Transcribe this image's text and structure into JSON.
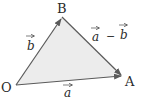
{
  "diagram": {
    "title": "",
    "type": "vector-triangle",
    "colors": {
      "fill": "#ececec",
      "stroke": "#5a5a5a",
      "text": "#2a2a2a",
      "background": "#ffffff"
    },
    "vertices": [
      {
        "id": "O",
        "label": "O",
        "x": 16,
        "y": 85
      },
      {
        "id": "B",
        "label": "B",
        "x": 62,
        "y": 17
      },
      {
        "id": "A",
        "label": "A",
        "x": 122,
        "y": 76
      }
    ],
    "edges": [
      {
        "from": "O",
        "to": "B",
        "label": "b",
        "arrow": true
      },
      {
        "from": "O",
        "to": "A",
        "label": "a",
        "arrow": true
      },
      {
        "from": "B",
        "to": "A",
        "label": "a − b",
        "arrow": true
      }
    ],
    "labels": {
      "O": "O",
      "A": "A",
      "B": "B",
      "vec_b": "b",
      "vec_a": "a",
      "vec_a2": "a",
      "minus": "−",
      "vec_b2": "b"
    }
  }
}
